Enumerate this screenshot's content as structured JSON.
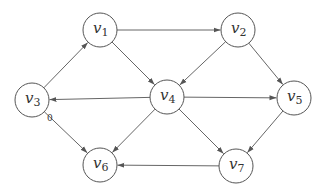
{
  "diagram": {
    "type": "directed-graph",
    "nodes": [
      {
        "id": "v1",
        "base": "v",
        "sub": "1",
        "x": 100,
        "y": 30
      },
      {
        "id": "v2",
        "base": "v",
        "sub": "2",
        "x": 238,
        "y": 30
      },
      {
        "id": "v3",
        "base": "v",
        "sub": "3",
        "x": 32,
        "y": 100
      },
      {
        "id": "v4",
        "base": "v",
        "sub": "4",
        "x": 167,
        "y": 97
      },
      {
        "id": "v5",
        "base": "v",
        "sub": "5",
        "x": 294,
        "y": 98
      },
      {
        "id": "v6",
        "base": "v",
        "sub": "6",
        "x": 100,
        "y": 165
      },
      {
        "id": "v7",
        "base": "v",
        "sub": "7",
        "x": 236,
        "y": 166
      }
    ],
    "edges": [
      {
        "from": "v3",
        "to": "v1"
      },
      {
        "from": "v1",
        "to": "v2"
      },
      {
        "from": "v1",
        "to": "v4"
      },
      {
        "from": "v2",
        "to": "v4"
      },
      {
        "from": "v2",
        "to": "v5"
      },
      {
        "from": "v4",
        "to": "v3"
      },
      {
        "from": "v4",
        "to": "v5"
      },
      {
        "from": "v3",
        "to": "v6"
      },
      {
        "from": "v4",
        "to": "v6"
      },
      {
        "from": "v4",
        "to": "v7"
      },
      {
        "from": "v5",
        "to": "v7"
      },
      {
        "from": "v7",
        "to": "v6"
      }
    ],
    "labels": [
      {
        "text": "0",
        "x": 47,
        "y": 121
      }
    ],
    "node_radius": 17,
    "colors": {
      "stroke": "#666666",
      "text": "#333333",
      "background": "#ffffff"
    }
  }
}
